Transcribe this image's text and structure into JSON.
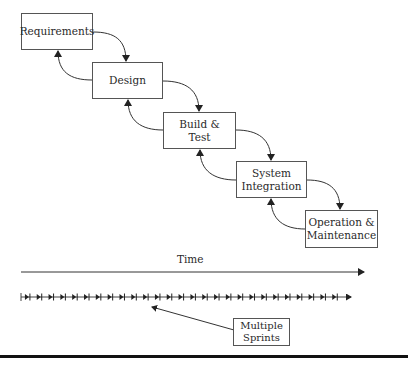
{
  "diagram": {
    "type": "waterfall-vs-agile",
    "phases": [
      {
        "id": "requirements",
        "label": "Requirements",
        "x": 21,
        "y": 13,
        "w": 72,
        "h": 37
      },
      {
        "id": "design",
        "label": "Design",
        "x": 92,
        "y": 62,
        "w": 71,
        "h": 37
      },
      {
        "id": "build-test",
        "label": "Build &\nTest",
        "x": 163,
        "y": 112,
        "w": 73,
        "h": 37
      },
      {
        "id": "system-integration",
        "label": "System\nIntegration",
        "x": 236,
        "y": 161,
        "w": 71,
        "h": 37
      },
      {
        "id": "operation-maintenance",
        "label": "Operation &\nMaintenance",
        "x": 305,
        "y": 210,
        "w": 73,
        "h": 38
      }
    ],
    "time_axis": {
      "label": "Time",
      "x_start": 21,
      "x_end": 366,
      "y": 272
    },
    "sprints": {
      "count": 28,
      "x_start": 21,
      "x_end": 352,
      "y": 297
    },
    "callout": {
      "label": "Multiple\nSprints",
      "x": 233,
      "y": 318,
      "w": 57,
      "h": 28
    },
    "colors": {
      "stroke": "#333333",
      "box_border": "#555555",
      "text": "#2a2a2a",
      "rule": "#111111"
    }
  }
}
